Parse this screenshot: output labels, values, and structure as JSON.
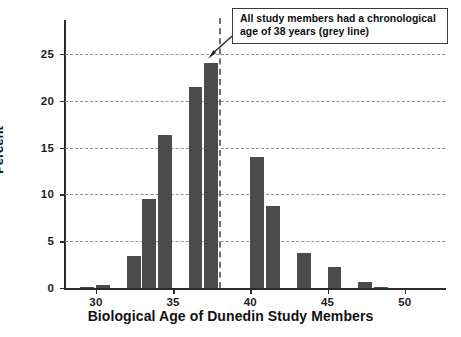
{
  "chart_data": {
    "type": "bar",
    "title": "",
    "subtitle": "",
    "xlabel": "Biological Age of Dunedin Study Members",
    "ylabel": "Percent",
    "xlim": [
      28.0,
      52.6
    ],
    "ylim": [
      0,
      28.4
    ],
    "xticks": [
      30,
      35,
      40,
      45,
      50
    ],
    "xtick_labels": [
      "30",
      "35",
      "40",
      "45",
      "50"
    ],
    "yticks": [
      0,
      5,
      10,
      15,
      20,
      25
    ],
    "ytick_labels": [
      "0",
      "5",
      "10",
      "15",
      "20",
      "25"
    ],
    "grid": "horizontal-dashed",
    "legend": "none",
    "bar_color": "#4b4b4d",
    "gridline_color": "#8d8d96",
    "axis_color": "#2b2b2b",
    "bin_width": 1,
    "bars": [
      {
        "x": 29,
        "value": 0.1
      },
      {
        "x": 30,
        "value": 0.3
      },
      {
        "x": 32,
        "value": 3.4
      },
      {
        "x": 33,
        "value": 9.5
      },
      {
        "x": 34,
        "value": 16.3
      },
      {
        "x": 36,
        "value": 21.5
      },
      {
        "x": 37,
        "value": 24.0
      },
      {
        "x": 40,
        "value": 14.0
      },
      {
        "x": 41,
        "value": 8.8
      },
      {
        "x": 43,
        "value": 3.7
      },
      {
        "x": 45,
        "value": 2.2
      },
      {
        "x": 47,
        "value": 0.6
      },
      {
        "x": 48,
        "value": 0.15
      }
    ],
    "reference_line": {
      "orientation": "vertical",
      "x": 38,
      "style": "dashed",
      "color": "#6f6f74",
      "label": "chronological age 38"
    },
    "annotations": [
      {
        "name": "chronological-age-callout",
        "lines": [
          "All study members had a chronological",
          "age of 38 years (grey line)"
        ],
        "points_to": "reference_line"
      }
    ]
  }
}
